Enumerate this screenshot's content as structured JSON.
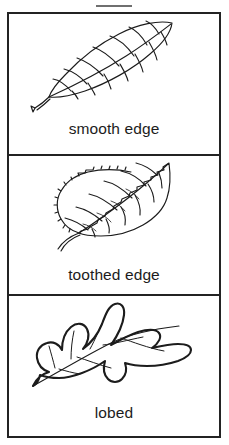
{
  "figure": {
    "background_color": "#ffffff",
    "border_color": "#232323",
    "ink_color": "#1c1c1c"
  },
  "panels": [
    {
      "id": "smooth",
      "label": "smooth edge",
      "illustration": "smooth-edge-leaf",
      "description": "Elliptical leaf with an unbroken, entire margin, pinnate veins and a slender petiole."
    },
    {
      "id": "toothed",
      "label": "toothed edge",
      "illustration": "toothed-edge-leaf",
      "description": "Ovate leaf with a finely serrated, saw-toothed margin, pinnate veins and a curved petiole."
    },
    {
      "id": "lobed",
      "label": "lobed",
      "illustration": "lobed-leaf",
      "description": "Oak-style leaf with deep rounded lobes and sinuses along both sides of the midrib."
    }
  ]
}
